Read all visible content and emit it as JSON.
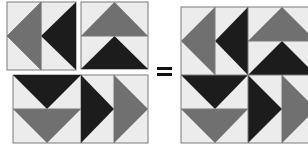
{
  "colors": {
    "background": "#ffffff",
    "light": "#ececec",
    "gray": "#707070",
    "dark": "#1c1c1c",
    "border": "#7a7a7a"
  },
  "operator": "=",
  "pieces": [
    {
      "name": "piece-left-arrows",
      "description": "Square with two left-pointing triangles (gray and black)"
    },
    {
      "name": "piece-up-arrows",
      "description": "Square with two up-pointing triangles (gray over black)"
    },
    {
      "name": "piece-bottom-row",
      "description": "Rectangle with two down-pointing triangles and two right-pointing triangles"
    }
  ],
  "result": {
    "name": "assembled-pinwheel-block",
    "description": "Combined square block of all pieces arranged in a pinwheel pattern"
  }
}
